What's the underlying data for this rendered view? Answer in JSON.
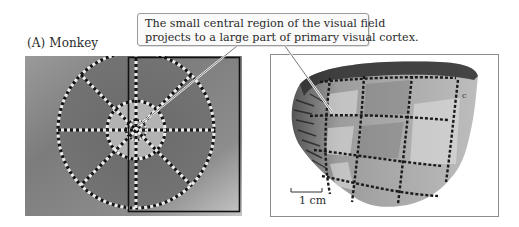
{
  "figure": {
    "panel_label": "(A) Monkey",
    "callout": {
      "line1": "The small central region of the visual field",
      "line2": "projects to a large part of primary visual cortex."
    },
    "left_panel": {
      "description": "visual-field map: concentric circles with radial dashed spokes on gray gradient",
      "highlight_rectangle": "right hemifield outline"
    },
    "right_panel": {
      "description": "flattened primary visual cortex with dashed grid pattern",
      "scale_bar_label": "1 cm",
      "corner_mark": "c"
    },
    "colors": {
      "background": "#ffffff",
      "gradient_light": "#c9c9c9",
      "gradient_dark": "#6e6e6e",
      "inner_disc": "#b5b5b5",
      "outer_ring": "#7a7a7a",
      "dash_dark": "#151515",
      "dash_light": "#e9e9e9",
      "frame": "#8c8c8c"
    }
  }
}
